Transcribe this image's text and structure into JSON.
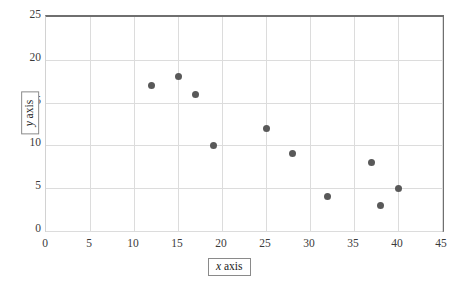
{
  "chart_data": {
    "type": "scatter",
    "title": "",
    "xlabel": "x axis",
    "ylabel": "y axis",
    "xlim": [
      0,
      45
    ],
    "ylim": [
      0,
      25
    ],
    "x_ticks": [
      0,
      5,
      10,
      15,
      20,
      25,
      30,
      35,
      40,
      45
    ],
    "y_ticks": [
      0,
      5,
      10,
      15,
      20,
      25
    ],
    "grid": true,
    "legend": false,
    "marker_color": "#595959",
    "gridline_color": "#dcdcdc",
    "border_color": "#6f6f6f",
    "points": [
      {
        "x": 12,
        "y": 17
      },
      {
        "x": 15,
        "y": 18
      },
      {
        "x": 17,
        "y": 16
      },
      {
        "x": 19,
        "y": 10
      },
      {
        "x": 25,
        "y": 12
      },
      {
        "x": 28,
        "y": 9
      },
      {
        "x": 32,
        "y": 4
      },
      {
        "x": 37,
        "y": 8
      },
      {
        "x": 38,
        "y": 3
      },
      {
        "x": 40,
        "y": 5
      }
    ]
  },
  "axis_titles": {
    "x_variable": "x",
    "x_word": " axis",
    "y_variable": "y",
    "y_word": " axis"
  }
}
